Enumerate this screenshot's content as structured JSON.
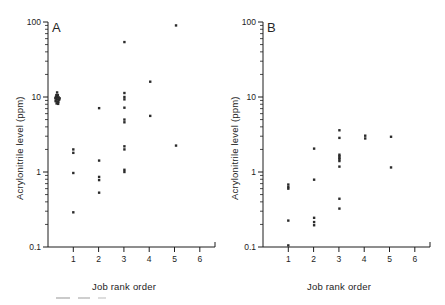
{
  "figure": {
    "panel_a_letter": "A",
    "panel_b_letter": "B",
    "axis_color": "#1d1d1d",
    "point_color": "#2b2b2b"
  },
  "chart_data": [
    {
      "type": "scatter",
      "panel": "A",
      "title": "A",
      "xlabel": "Job rank order",
      "ylabel": "Acrylonitrile level (ppm)",
      "yscale": "log",
      "ylim": [
        0.1,
        100
      ],
      "ytick_labels": [
        "0.1",
        "1",
        "10",
        "100"
      ],
      "ytick_values": [
        0.1,
        1,
        10,
        100
      ],
      "xlim": [
        0,
        6.6
      ],
      "xtick_labels": [
        "1",
        "2",
        "3",
        "4",
        "5",
        "6"
      ],
      "xtick_values": [
        1,
        2,
        3,
        4,
        5,
        6
      ],
      "grid": false,
      "legend": "none",
      "points": [
        {
          "x": 0.36,
          "y": 11.5
        },
        {
          "x": 0.33,
          "y": 10.6
        },
        {
          "x": 0.39,
          "y": 10.6
        },
        {
          "x": 0.31,
          "y": 10.0
        },
        {
          "x": 0.36,
          "y": 10.0
        },
        {
          "x": 0.42,
          "y": 9.9
        },
        {
          "x": 0.33,
          "y": 9.4
        },
        {
          "x": 0.38,
          "y": 9.3
        },
        {
          "x": 0.44,
          "y": 9.2
        },
        {
          "x": 0.3,
          "y": 8.8
        },
        {
          "x": 0.36,
          "y": 8.7
        },
        {
          "x": 0.41,
          "y": 8.6
        },
        {
          "x": 0.34,
          "y": 8.2
        },
        {
          "x": 0.4,
          "y": 8.1
        },
        {
          "x": 0.46,
          "y": 9.6
        },
        {
          "x": 0.29,
          "y": 9.6
        },
        {
          "x": 1.0,
          "y": 2.0
        },
        {
          "x": 1.0,
          "y": 1.8
        },
        {
          "x": 1.0,
          "y": 0.97
        },
        {
          "x": 1.0,
          "y": 0.29
        },
        {
          "x": 2.02,
          "y": 7.1
        },
        {
          "x": 2.02,
          "y": 1.42
        },
        {
          "x": 2.02,
          "y": 0.86
        },
        {
          "x": 2.02,
          "y": 0.78
        },
        {
          "x": 2.02,
          "y": 0.53
        },
        {
          "x": 3.02,
          "y": 54.0
        },
        {
          "x": 3.02,
          "y": 11.3
        },
        {
          "x": 3.02,
          "y": 10.0
        },
        {
          "x": 3.02,
          "y": 9.3
        },
        {
          "x": 3.02,
          "y": 7.2
        },
        {
          "x": 3.02,
          "y": 5.0
        },
        {
          "x": 3.02,
          "y": 4.6
        },
        {
          "x": 3.02,
          "y": 2.2
        },
        {
          "x": 3.02,
          "y": 2.0
        },
        {
          "x": 3.02,
          "y": 1.07
        },
        {
          "x": 3.02,
          "y": 1.0
        },
        {
          "x": 4.04,
          "y": 16.0
        },
        {
          "x": 4.04,
          "y": 5.6
        },
        {
          "x": 5.06,
          "y": 90.0
        },
        {
          "x": 5.06,
          "y": 2.25
        }
      ]
    },
    {
      "type": "scatter",
      "panel": "B",
      "title": "B",
      "xlabel": "Job rank order",
      "ylabel": "Acrylonitrile level (ppm)",
      "yscale": "log",
      "ylim": [
        0.1,
        100
      ],
      "ytick_labels": [
        "0.1",
        "1",
        "10",
        "100"
      ],
      "ytick_values": [
        0.1,
        1,
        10,
        100
      ],
      "xlim": [
        0,
        6.6
      ],
      "xtick_labels": [
        "1",
        "2",
        "3",
        "4",
        "5",
        "6"
      ],
      "xtick_values": [
        1,
        2,
        3,
        4,
        5,
        6
      ],
      "grid": false,
      "legend": "none",
      "points": [
        {
          "x": 1.0,
          "y": 0.68
        },
        {
          "x": 1.0,
          "y": 0.63
        },
        {
          "x": 1.0,
          "y": 0.6
        },
        {
          "x": 1.0,
          "y": 0.225
        },
        {
          "x": 1.0,
          "y": 0.105
        },
        {
          "x": 2.02,
          "y": 2.05
        },
        {
          "x": 2.02,
          "y": 0.79
        },
        {
          "x": 2.02,
          "y": 0.245
        },
        {
          "x": 2.02,
          "y": 0.215
        },
        {
          "x": 2.02,
          "y": 0.195
        },
        {
          "x": 3.02,
          "y": 3.6
        },
        {
          "x": 3.02,
          "y": 2.85
        },
        {
          "x": 3.02,
          "y": 1.7
        },
        {
          "x": 3.02,
          "y": 1.62
        },
        {
          "x": 3.02,
          "y": 1.55
        },
        {
          "x": 3.02,
          "y": 1.48
        },
        {
          "x": 3.02,
          "y": 1.4
        },
        {
          "x": 3.02,
          "y": 1.18
        },
        {
          "x": 3.02,
          "y": 0.44
        },
        {
          "x": 3.02,
          "y": 0.325
        },
        {
          "x": 4.04,
          "y": 3.05
        },
        {
          "x": 4.04,
          "y": 2.8
        },
        {
          "x": 5.06,
          "y": 2.95
        },
        {
          "x": 5.06,
          "y": 1.15
        }
      ]
    }
  ]
}
